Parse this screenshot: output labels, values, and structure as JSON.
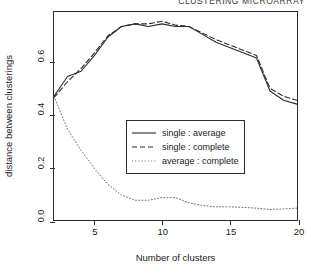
{
  "running_head": "CLUSTERING MICROARRAY",
  "chart_data": {
    "type": "line",
    "title": "",
    "xlabel": "Number of clusters",
    "ylabel": "distance between clusterings",
    "xlim": [
      2,
      20
    ],
    "ylim": [
      0.0,
      0.79
    ],
    "xticks": [
      5,
      10,
      15,
      20
    ],
    "xticklabels": [
      "5",
      "10",
      "15",
      "20"
    ],
    "yticks": [
      0.0,
      0.2,
      0.4,
      0.6
    ],
    "yticklabels": [
      "0.0",
      "0.2",
      "0.4",
      "0.6"
    ],
    "grid": false,
    "legend_position": "center",
    "x": [
      2,
      3,
      4,
      5,
      6,
      7,
      8,
      9,
      10,
      11,
      12,
      13,
      14,
      15,
      16,
      17,
      18,
      19,
      20
    ],
    "series": [
      {
        "name": "single : average",
        "style": "solid",
        "color": "#2b2b2b",
        "values": [
          0.47,
          0.545,
          0.565,
          0.625,
          0.695,
          0.735,
          0.745,
          0.735,
          0.745,
          0.735,
          0.735,
          0.705,
          0.675,
          0.655,
          0.635,
          0.615,
          0.49,
          0.455,
          0.44
        ]
      },
      {
        "name": "single : complete",
        "style": "dashed",
        "color": "#2b2b2b",
        "values": [
          0.465,
          0.525,
          0.575,
          0.635,
          0.7,
          0.735,
          0.745,
          0.745,
          0.755,
          0.74,
          0.735,
          0.71,
          0.685,
          0.665,
          0.645,
          0.625,
          0.5,
          0.47,
          0.455
        ]
      },
      {
        "name": "average : complete",
        "style": "dotted",
        "color": "#6e6e6e",
        "values": [
          0.47,
          0.345,
          0.265,
          0.195,
          0.135,
          0.095,
          0.075,
          0.075,
          0.085,
          0.085,
          0.065,
          0.055,
          0.05,
          0.05,
          0.048,
          0.045,
          0.04,
          0.042,
          0.045
        ]
      }
    ],
    "legend": [
      {
        "label": "single : average",
        "style": "solid"
      },
      {
        "label": "single : complete",
        "style": "dashed"
      },
      {
        "label": "average : complete",
        "style": "dotted"
      }
    ]
  }
}
